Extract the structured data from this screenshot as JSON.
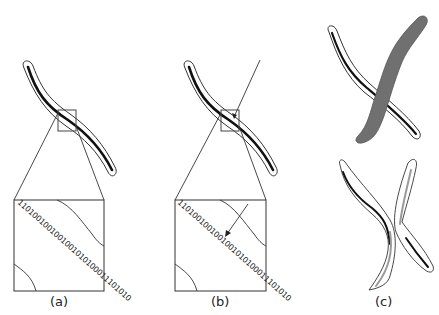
{
  "figure": {
    "panels": [
      {
        "id": "a",
        "label": "(a)",
        "description": "Chromosome curve with zoomed region showing binary code along its axis"
      },
      {
        "id": "b",
        "label": "(b)",
        "description": "Same curve with direction line/arrow indicating traversal across binary axis"
      },
      {
        "id": "c",
        "label": "(c)",
        "description": "Overlapping chromosomes (top) and separated chromosomes (bottom)"
      }
    ],
    "binary_string": "1101001001001001010100011101010",
    "colors": {
      "stroke": "#333333",
      "axis": "#111111",
      "overlap_fill": "#707070",
      "gray_axis": "#9a9a9a"
    }
  }
}
